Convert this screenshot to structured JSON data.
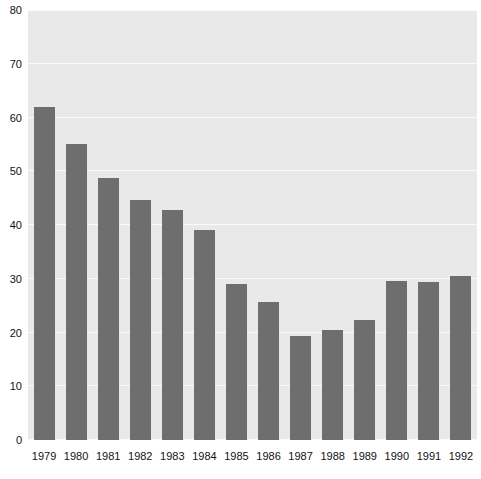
{
  "chart_data": {
    "type": "bar",
    "title": "",
    "subtitle": "",
    "xlabel": "",
    "ylabel": "",
    "categories": [
      "1979",
      "1980",
      "1981",
      "1982",
      "1983",
      "1984",
      "1985",
      "1986",
      "1987",
      "1988",
      "1989",
      "1990",
      "1991",
      "1992"
    ],
    "values": [
      62.0,
      55.0,
      48.7,
      44.6,
      42.8,
      39.0,
      29.0,
      25.6,
      19.4,
      20.5,
      22.4,
      29.5,
      29.4,
      30.5
    ],
    "ylim": [
      0,
      80
    ],
    "yticks": [
      0,
      10,
      20,
      30,
      40,
      50,
      60,
      70,
      80
    ],
    "ytick_labels": [
      "0",
      "10",
      "20",
      "30",
      "40",
      "50",
      "60",
      "70",
      "80"
    ],
    "xtick_labels": [
      "1979",
      "1980",
      "1981",
      "1982",
      "1983",
      "1984",
      "1985",
      "1986",
      "1987",
      "1988",
      "1989",
      "1990",
      "1991",
      "1992"
    ],
    "grid": true,
    "grid_axis": "y",
    "legend": false,
    "legend_position": "none",
    "annotations": [],
    "series": [
      {
        "name": "",
        "values": [
          62.0,
          55.0,
          48.7,
          44.6,
          42.8,
          39.0,
          29.0,
          25.6,
          19.4,
          20.5,
          22.4,
          29.5,
          29.4,
          30.5
        ]
      }
    ]
  },
  "style": {
    "bar_color": "#6e6e6e",
    "plot_background": "#e9e9e9",
    "gridline_color": "#fbfbfb",
    "page_background": "#ffffff",
    "tick_label_color": "#111111"
  }
}
